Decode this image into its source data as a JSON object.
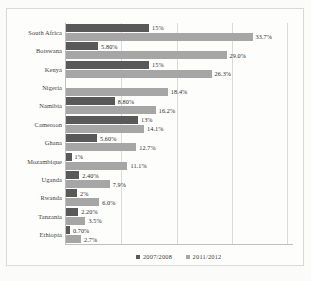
{
  "chart_data": {
    "type": "bar",
    "orientation": "horizontal",
    "title": "",
    "xlabel": "",
    "ylabel": "",
    "xlim": [
      0,
      41
    ],
    "grid": true,
    "gridlines": [
      10,
      20,
      30,
      40
    ],
    "legend_position": "bottom",
    "categories": [
      "South Africa",
      "Botswana",
      "Kenya",
      "Nigeria",
      "Namibia",
      "Cameroon",
      "Ghana",
      "Mozambique",
      "Uganda",
      "Rwanda",
      "Tanzania",
      "Ethiopia"
    ],
    "series": [
      {
        "name": "2007/2008",
        "color": "#595959",
        "values": [
          15,
          5.8,
          15,
          0,
          8.8,
          13,
          5.6,
          1,
          2.4,
          2,
          2.2,
          0.7
        ],
        "labels": [
          "15%",
          "5.80%",
          "15%",
          "",
          "8.80%",
          "13%",
          "5.60%",
          "1%",
          "2.40%",
          "2%",
          "2.20%",
          "0.70%"
        ]
      },
      {
        "name": "2011/2012",
        "color": "#a6a6a6",
        "values": [
          33.7,
          29.0,
          26.3,
          18.4,
          16.2,
          14.1,
          12.7,
          11.1,
          7.9,
          6.0,
          3.5,
          2.7
        ],
        "labels": [
          "33.7%",
          "29.0%",
          "26.3%",
          "18.4%",
          "16.2%",
          "14.1%",
          "12.7%",
          "11.1%",
          "7.9%",
          "6.0%",
          "3.5%",
          "2.7%"
        ]
      }
    ]
  },
  "legend": {
    "items": [
      {
        "label": "2007/2008",
        "color": "#595959"
      },
      {
        "label": "2011/2012",
        "color": "#a6a6a6"
      }
    ]
  }
}
